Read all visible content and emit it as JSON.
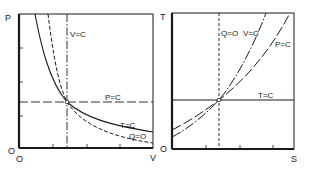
{
  "diagrams": [
    {
      "id": "pv",
      "y_axis_label": "P",
      "x_axis_label": "V",
      "origin_y_label": "O",
      "origin_x_label": "O",
      "curves": [
        {
          "label": "V=C",
          "style": "dash-dot",
          "kind": "vertical"
        },
        {
          "label": "P=C",
          "style": "long-dash",
          "kind": "horizontal"
        },
        {
          "label": "T=C",
          "style": "solid",
          "kind": "hyperbola"
        },
        {
          "label": "Q=O",
          "style": "dashed",
          "kind": "adiabat"
        }
      ]
    },
    {
      "id": "ts",
      "y_axis_label": "T",
      "x_axis_label": "S",
      "origin_label": "O",
      "curves": [
        {
          "label": "Q=O",
          "style": "dashed",
          "kind": "vertical"
        },
        {
          "label": "V=C",
          "style": "dash-dot",
          "kind": "exponential-steep"
        },
        {
          "label": "P=C",
          "style": "long-dash",
          "kind": "exponential"
        },
        {
          "label": "T=C",
          "style": "solid",
          "kind": "horizontal"
        }
      ]
    }
  ],
  "colors": {
    "line": "#1a1a1a",
    "background": "#ffffff"
  }
}
